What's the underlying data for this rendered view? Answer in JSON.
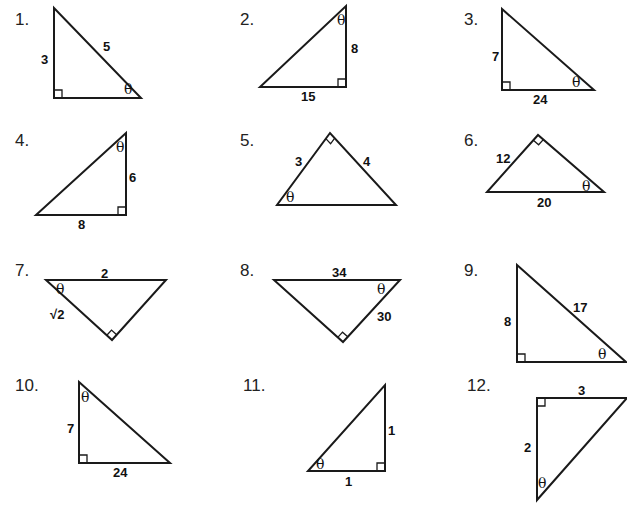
{
  "problems": [
    {
      "number": "1.",
      "num_pos": [
        15,
        25
      ],
      "vertices": [
        [
          54,
          8
        ],
        [
          54,
          98
        ],
        [
          141,
          98
        ]
      ],
      "right_angle": {
        "corner": [
          54,
          98
        ],
        "dx": 1,
        "dy": -1
      },
      "labels": [
        {
          "text": "3",
          "pos": [
            41,
            64
          ],
          "type": "side"
        },
        {
          "text": "5",
          "pos": [
            103,
            51
          ],
          "type": "side"
        },
        {
          "text": "θ",
          "pos": [
            124,
            94
          ],
          "type": "theta"
        }
      ]
    },
    {
      "number": "2.",
      "num_pos": [
        240,
        25
      ],
      "vertices": [
        [
          346,
          6
        ],
        [
          346,
          87
        ],
        [
          260,
          87
        ]
      ],
      "right_angle": {
        "corner": [
          346,
          87
        ],
        "dx": -1,
        "dy": -1
      },
      "labels": [
        {
          "text": "8",
          "pos": [
            351,
            53
          ],
          "type": "side"
        },
        {
          "text": "15",
          "pos": [
            301,
            101
          ],
          "type": "side"
        },
        {
          "text": "θ",
          "pos": [
            337,
            25
          ],
          "type": "theta"
        }
      ]
    },
    {
      "number": "3.",
      "num_pos": [
        464,
        25
      ],
      "vertices": [
        [
          502,
          9
        ],
        [
          502,
          90
        ],
        [
          594,
          90
        ]
      ],
      "right_angle": {
        "corner": [
          502,
          90
        ],
        "dx": 1,
        "dy": -1
      },
      "labels": [
        {
          "text": "7",
          "pos": [
            492,
            61
          ],
          "type": "side"
        },
        {
          "text": "24",
          "pos": [
            533,
            104
          ],
          "type": "side"
        },
        {
          "text": "θ",
          "pos": [
            572,
            87
          ],
          "type": "theta"
        }
      ]
    },
    {
      "number": "4.",
      "num_pos": [
        15,
        146
      ],
      "vertices": [
        [
          126,
          133
        ],
        [
          126,
          215
        ],
        [
          36,
          215
        ]
      ],
      "right_angle": {
        "corner": [
          126,
          215
        ],
        "dx": -1,
        "dy": -1
      },
      "labels": [
        {
          "text": "6",
          "pos": [
            129,
            182
          ],
          "type": "side"
        },
        {
          "text": "8",
          "pos": [
            78,
            229
          ],
          "type": "side"
        },
        {
          "text": "θ",
          "pos": [
            116,
            152
          ],
          "type": "theta"
        }
      ]
    },
    {
      "number": "5.",
      "num_pos": [
        240,
        146
      ],
      "vertices": [
        [
          330,
          133
        ],
        [
          277,
          205
        ],
        [
          396,
          205
        ]
      ],
      "right_angle": {
        "corner": [
          330,
          133
        ],
        "type": "diamond"
      },
      "labels": [
        {
          "text": "3",
          "pos": [
            295,
            166
          ],
          "type": "side"
        },
        {
          "text": "4",
          "pos": [
            363,
            166
          ],
          "type": "side"
        },
        {
          "text": "θ",
          "pos": [
            286,
            202
          ],
          "type": "theta"
        }
      ]
    },
    {
      "number": "6.",
      "num_pos": [
        464,
        146
      ],
      "vertices": [
        [
          538,
          135
        ],
        [
          487,
          192
        ],
        [
          604,
          192
        ]
      ],
      "right_angle": {
        "corner": [
          538,
          135
        ],
        "type": "diamond"
      },
      "labels": [
        {
          "text": "12",
          "pos": [
            496,
            163
          ],
          "type": "side"
        },
        {
          "text": "20",
          "pos": [
            537,
            207
          ],
          "type": "side"
        },
        {
          "text": "θ",
          "pos": [
            582,
            191
          ],
          "type": "theta"
        }
      ]
    },
    {
      "number": "7.",
      "num_pos": [
        15,
        276
      ],
      "vertices": [
        [
          46,
          280
        ],
        [
          166,
          280
        ],
        [
          112,
          340
        ]
      ],
      "right_angle": {
        "corner": [
          112,
          340
        ],
        "type": "diamond"
      },
      "labels": [
        {
          "text": "2",
          "pos": [
            101,
            278
          ],
          "type": "side"
        },
        {
          "text": "θ",
          "pos": [
            56,
            294
          ],
          "type": "theta"
        },
        {
          "text": "√2",
          "pos": [
            50,
            319
          ],
          "type": "side"
        }
      ]
    },
    {
      "number": "8.",
      "num_pos": [
        240,
        276
      ],
      "vertices": [
        [
          274,
          280
        ],
        [
          400,
          280
        ],
        [
          343,
          342
        ]
      ],
      "right_angle": {
        "corner": [
          343,
          342
        ],
        "type": "diamond"
      },
      "labels": [
        {
          "text": "34",
          "pos": [
            332,
            277
          ],
          "type": "side"
        },
        {
          "text": "θ",
          "pos": [
            377,
            294
          ],
          "type": "theta"
        },
        {
          "text": "30",
          "pos": [
            377,
            321
          ],
          "type": "side"
        }
      ]
    },
    {
      "number": "9.",
      "num_pos": [
        464,
        276
      ],
      "vertices": [
        [
          517,
          265
        ],
        [
          517,
          362
        ],
        [
          626,
          362
        ]
      ],
      "right_angle": {
        "corner": [
          517,
          362
        ],
        "dx": 1,
        "dy": -1
      },
      "labels": [
        {
          "text": "8",
          "pos": [
            504,
            326
          ],
          "type": "side"
        },
        {
          "text": "17",
          "pos": [
            573,
            312
          ],
          "type": "side"
        },
        {
          "text": "θ",
          "pos": [
            598,
            359
          ],
          "type": "theta"
        }
      ]
    },
    {
      "number": "10.",
      "num_pos": [
        15,
        391
      ],
      "vertices": [
        [
          79,
          382
        ],
        [
          79,
          463
        ],
        [
          170,
          463
        ]
      ],
      "right_angle": {
        "corner": [
          79,
          463
        ],
        "dx": 1,
        "dy": -1
      },
      "labels": [
        {
          "text": "7",
          "pos": [
            67,
            433
          ],
          "type": "side"
        },
        {
          "text": "θ",
          "pos": [
            81,
            402
          ],
          "type": "theta"
        },
        {
          "text": "24",
          "pos": [
            113,
            477
          ],
          "type": "side"
        }
      ]
    },
    {
      "number": "11.",
      "num_pos": [
        243,
        391
      ],
      "vertices": [
        [
          385,
          385
        ],
        [
          385,
          471
        ],
        [
          308,
          471
        ]
      ],
      "right_angle": {
        "corner": [
          385,
          471
        ],
        "dx": -1,
        "dy": -1
      },
      "labels": [
        {
          "text": "1",
          "pos": [
            388,
            435
          ],
          "type": "side"
        },
        {
          "text": "θ",
          "pos": [
            316,
            469
          ],
          "type": "theta"
        },
        {
          "text": "1",
          "pos": [
            345,
            486
          ],
          "type": "side"
        }
      ]
    },
    {
      "number": "12.",
      "num_pos": [
        467,
        391
      ],
      "vertices": [
        [
          537,
          398
        ],
        [
          627,
          398
        ],
        [
          537,
          500
        ]
      ],
      "right_angle": {
        "corner": [
          537,
          398
        ],
        "dx": 1,
        "dy": 1
      },
      "labels": [
        {
          "text": "3",
          "pos": [
            578,
            395
          ],
          "type": "side"
        },
        {
          "text": "2",
          "pos": [
            524,
            452
          ],
          "type": "side"
        },
        {
          "text": "θ",
          "pos": [
            538,
            488
          ],
          "type": "theta"
        }
      ]
    }
  ],
  "colors": {
    "ink": "#1a1a1a",
    "background": "#ffffff"
  }
}
